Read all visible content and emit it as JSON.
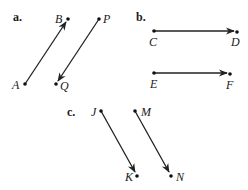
{
  "figure": {
    "panels": [
      {
        "label": "a.",
        "vectors": [
          {
            "from": {
              "name": "A",
              "x": 25,
              "y": 84
            },
            "to": {
              "name": "B",
              "x": 68,
              "y": 19
            }
          },
          {
            "from": {
              "name": "P",
              "x": 99,
              "y": 19
            },
            "to": {
              "name": "Q",
              "x": 56,
              "y": 84
            }
          }
        ]
      },
      {
        "label": "b.",
        "vectors": [
          {
            "from": {
              "name": "C",
              "x": 154,
              "y": 31
            },
            "to": {
              "name": "D",
              "x": 237,
              "y": 31
            }
          },
          {
            "from": {
              "name": "E",
              "x": 154,
              "y": 73
            },
            "to": {
              "name": "F",
              "x": 230,
              "y": 73
            }
          }
        ]
      },
      {
        "label": "c.",
        "vectors": [
          {
            "from": {
              "name": "J",
              "x": 101,
              "y": 111
            },
            "to": {
              "name": "K",
              "x": 137,
              "y": 176
            }
          },
          {
            "from": {
              "name": "M",
              "x": 135,
              "y": 111
            },
            "to": {
              "name": "N",
              "x": 171,
              "y": 176
            }
          }
        ]
      }
    ]
  },
  "labels": {
    "a": "a.",
    "b": "b.",
    "c": "c.",
    "A": "A",
    "B": "B",
    "P": "P",
    "Q": "Q",
    "C": "C",
    "D": "D",
    "E": "E",
    "F": "F",
    "J": "J",
    "K": "K",
    "M": "M",
    "N": "N"
  }
}
